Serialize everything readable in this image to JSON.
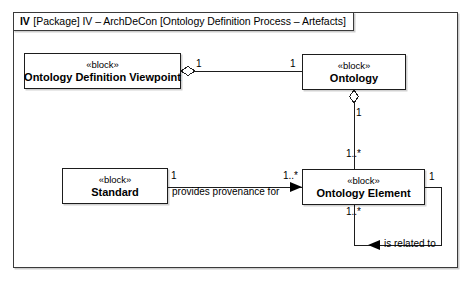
{
  "diagram": {
    "type": "uml-block-definition-diagram",
    "frame": {
      "tab_prefix": "IV",
      "tab_text": "[Package] IV – ArchDeCon [Ontology Definition Process – Artefacts]"
    },
    "blocks": [
      {
        "id": "ontology-definition-viewpoint",
        "stereotype": "«block»",
        "name": "Ontology Definition Viewpoint"
      },
      {
        "id": "ontology",
        "stereotype": "«block»",
        "name": "Ontology"
      },
      {
        "id": "standard",
        "stereotype": "«block»",
        "name": "Standard"
      },
      {
        "id": "ontology-element",
        "stereotype": "«block»",
        "name": "Ontology Element"
      }
    ],
    "relationships": [
      {
        "id": "viewpoint-aggregates-ontology",
        "kind": "aggregation",
        "source": "ontology-definition-viewpoint",
        "target": "ontology",
        "source_multiplicity": "1",
        "target_multiplicity": "1",
        "label": ""
      },
      {
        "id": "ontology-aggregates-element",
        "kind": "aggregation",
        "source": "ontology",
        "target": "ontology-element",
        "source_multiplicity": "1",
        "target_multiplicity": "1..*",
        "label": ""
      },
      {
        "id": "standard-provides-provenance",
        "kind": "directed-association",
        "source": "standard",
        "target": "ontology-element",
        "source_multiplicity": "1",
        "target_multiplicity": "1..*",
        "label": "provides provenance for",
        "arrow": "▶"
      },
      {
        "id": "element-is-related-to-element",
        "kind": "directed-association-self",
        "source": "ontology-element",
        "target": "ontology-element",
        "source_multiplicity": "1..*",
        "target_multiplicity": "1",
        "label": "is related to",
        "arrow": "◀"
      }
    ],
    "multiplicity_labels": {
      "viewpoint_right": "1",
      "ontology_left": "1",
      "ontology_bottom": "1",
      "element_top": "1..*",
      "standard_right": "1",
      "element_left": "1..*",
      "element_right": "1",
      "element_bottom": "1..*"
    },
    "colors": {
      "line": "#1d1d1d",
      "frame": "#3a3a3a",
      "background": "#ffffff",
      "text": "#000000"
    }
  }
}
